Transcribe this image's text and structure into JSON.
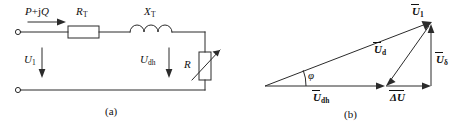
{
  "figure": {
    "stroke_color": "#2b2b2b",
    "text_color": "#111111",
    "background": "#ffffff"
  },
  "panel_a": {
    "caption": "(a)",
    "power_label": "P",
    "power_plus": "+j",
    "power_q": "Q",
    "resistor_label": "R",
    "resistor_sub": "T",
    "reactance_label": "X",
    "reactance_sub": "T",
    "source_voltage_label": "U",
    "source_voltage_sub": "1",
    "load_voltage_label": "U",
    "load_voltage_sub": "dh",
    "variable_resistor_label": "R",
    "elements": [
      {
        "name": "input-terminal-top",
        "type": "terminal"
      },
      {
        "name": "input-terminal-bottom",
        "type": "terminal"
      },
      {
        "name": "series-resistor",
        "type": "resistor"
      },
      {
        "name": "series-inductor",
        "type": "inductor"
      },
      {
        "name": "variable-resistor",
        "type": "variable-resistor"
      },
      {
        "name": "power-flow-arrow",
        "type": "arrow"
      },
      {
        "name": "source-voltage-arrow",
        "type": "arrow"
      },
      {
        "name": "load-voltage-arrow",
        "type": "arrow"
      }
    ]
  },
  "panel_b": {
    "caption": "(b)",
    "u1_label": "U",
    "u1_sub": "1",
    "ud_label": "U",
    "ud_sub": "d",
    "udelta_label": "U",
    "udelta_sub": "δ",
    "udh_label": "U",
    "udh_sub": "dh",
    "delta_u_label": "ΔU",
    "phi_label": "φ",
    "vectors": [
      {
        "name": "u1-vector",
        "label": "U1",
        "from": [
          25,
          82
        ],
        "to": [
          200,
          18
        ]
      },
      {
        "name": "udh-vector",
        "label": "Udh",
        "from": [
          25,
          82
        ],
        "to": [
          150,
          82
        ]
      },
      {
        "name": "delta-u-vector",
        "label": "ΔU",
        "from": [
          150,
          82
        ],
        "to": [
          200,
          82
        ]
      },
      {
        "name": "udelta-vector",
        "label": "Uδ",
        "from": [
          200,
          82
        ],
        "to": [
          200,
          18
        ]
      },
      {
        "name": "ud-vector",
        "label": "Ud",
        "from": [
          200,
          18
        ],
        "to": [
          150,
          82
        ]
      }
    ],
    "angle": {
      "name": "phi-angle",
      "value": "φ",
      "vertex": [
        25,
        82
      ]
    }
  }
}
